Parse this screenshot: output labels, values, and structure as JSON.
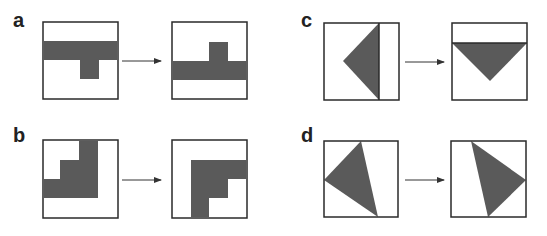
{
  "panels": [
    {
      "id": "a",
      "label": "a"
    },
    {
      "id": "b",
      "label": "b"
    },
    {
      "id": "c",
      "label": "c"
    },
    {
      "id": "d",
      "label": "d"
    }
  ],
  "colors": {
    "shape_fill": "#5a5a5a",
    "frame_stroke": "#2a2a2a",
    "arrow": "#333333",
    "background": "#ffffff"
  }
}
